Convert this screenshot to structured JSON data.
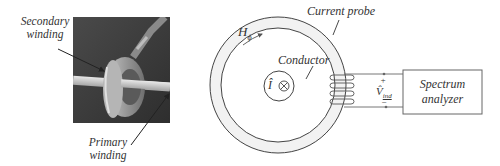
{
  "figure": {
    "photo": {
      "labels": {
        "secondary_line1": "Secondary",
        "secondary_line2": "winding",
        "primary_line1": "Primary",
        "primary_line2": "winding"
      }
    },
    "schematic": {
      "h_field_label": "H",
      "h_field_subscript": "ϕ",
      "current_probe_label": "Current probe",
      "conductor_label": "Conductor",
      "current_symbol": "Î",
      "current_direction_symbol": "⊗",
      "voltage_label": "V̂",
      "voltage_subscript": "ind",
      "plus_sign": "+",
      "minus_sign": "−",
      "analyzer_line1": "Spectrum",
      "analyzer_line2": "analyzer"
    }
  }
}
